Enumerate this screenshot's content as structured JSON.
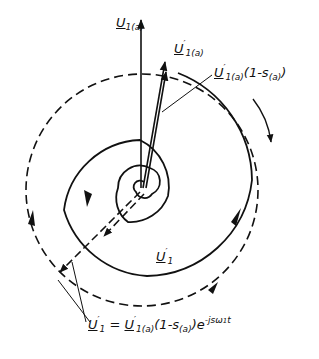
{
  "diagram": {
    "type": "phasor spiral diagram",
    "labels": {
      "u1a": {
        "main": "U",
        "sub": "1(a)"
      },
      "u1a_prime": {
        "main": "U",
        "prime": "′",
        "sub": "1(a)"
      },
      "u1a_prime_slip": {
        "main": "U",
        "prime": "′",
        "sub": "1(a)",
        "rest": "(1-s",
        "rest_sub": "(a)",
        "rest_end": ")"
      },
      "u1_prime": {
        "main": "U",
        "prime": "′",
        "sub": "1"
      },
      "formula": {
        "lhs_main": "U",
        "lhs_prime": "′",
        "lhs_sub": "1",
        "eq": " = ",
        "rhs_main": "U",
        "rhs_prime": "′",
        "rhs_sub": "1(a)",
        "factor": "(1-s",
        "factor_sub": "(a)",
        "factor_end": ")",
        "exp_base": "e",
        "exp": "-jsω",
        "exp_sub": "1",
        "exp_t": "t"
      }
    },
    "colors": {
      "stroke": "#111111",
      "background": "#ffffff"
    }
  }
}
